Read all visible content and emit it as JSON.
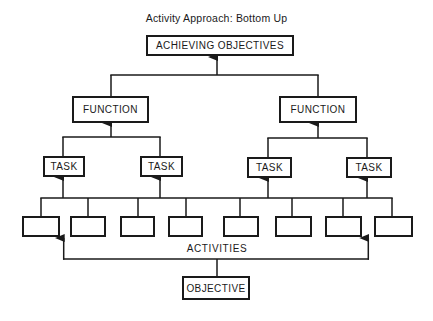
{
  "title": "Activity Approach:  Bottom Up",
  "nodes": {
    "top": "ACHIEVING OBJECTIVES",
    "functions": [
      "FUNCTION",
      "FUNCTION"
    ],
    "tasks": [
      "TASK",
      "TASK",
      "TASK",
      "TASK"
    ],
    "activities_label": "ACTIVITIES",
    "activities": [
      "",
      "",
      "",
      "",
      "",
      "",
      "",
      ""
    ],
    "objective": "OBJECTIVE"
  },
  "colors": {
    "line": "#1a1a1a",
    "background": "#ffffff"
  }
}
